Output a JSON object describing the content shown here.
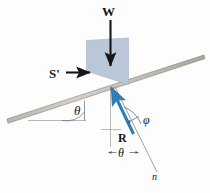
{
  "figure": {
    "background_color": "#fdfdfd"
  },
  "colors": {
    "block_fill": "#b9c7d8",
    "block_stroke": "#9aa9bc",
    "incline_fill": "#c9c7bd",
    "incline_stroke": "#6d6b62",
    "vector_black": "#161616",
    "vector_blue": "#2f7cb6",
    "guide_gray": "#8f8f8f",
    "label_color": "#161616"
  },
  "labels": {
    "weight": "W",
    "applied_force": "S'",
    "resultant": "R",
    "incline_angle": "θ",
    "normal_angle": "θ",
    "friction_angle": "φ",
    "normal_axis": "n"
  },
  "elements": {
    "weight_vector": {
      "name": "weight-force-vector",
      "label": "W",
      "direction": "down",
      "color": "#161616"
    },
    "applied_vector": {
      "name": "applied-force-vector",
      "label": "S'",
      "direction": "right",
      "color": "#161616"
    },
    "resultant_vector": {
      "name": "resultant-force-vector",
      "label": "R",
      "direction": "up-left",
      "color": "#2f7cb6"
    },
    "block": {
      "name": "block-body",
      "fill": "#b9c7d8"
    },
    "incline": {
      "name": "inclined-surface",
      "fill": "#c9c7bd"
    },
    "normal_line": {
      "name": "normal-axis-line",
      "label": "n"
    },
    "vertical_guide": {
      "name": "vertical-reference-line"
    },
    "horizontal_guide": {
      "name": "horizontal-reference-line"
    }
  },
  "angles": {
    "incline_from_horizontal": {
      "symbol": "θ",
      "between": "incline surface and horizontal"
    },
    "resultant_from_vertical": {
      "symbol": "θ",
      "between": "resultant vector and vertical"
    },
    "resultant_from_normal": {
      "symbol": "φ",
      "between": "resultant vector and surface normal"
    }
  }
}
